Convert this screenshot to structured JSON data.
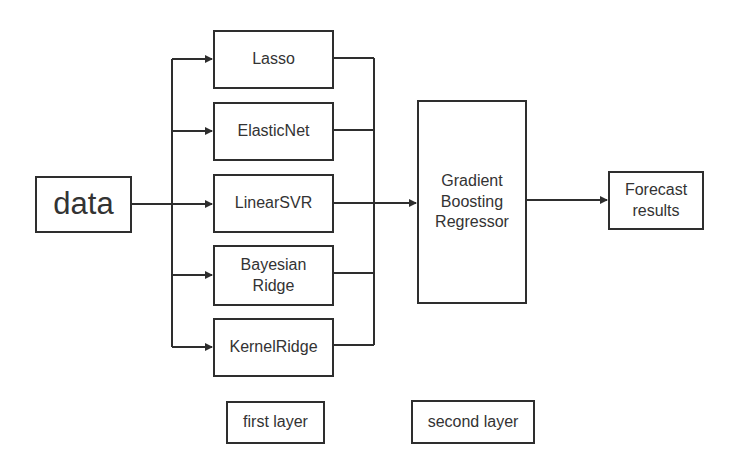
{
  "diagram": {
    "type": "stacking-ensemble-flowchart",
    "input": {
      "label": "data"
    },
    "first_layer": {
      "models": [
        {
          "id": "lasso",
          "label": "Lasso"
        },
        {
          "id": "elasticnet",
          "label": "ElasticNet"
        },
        {
          "id": "linearsvr",
          "label": "LinearSVR"
        },
        {
          "id": "bayesianridge",
          "label_line1": "Bayesian",
          "label_line2": "Ridge"
        },
        {
          "id": "kernelridge",
          "label": "KernelRidge"
        }
      ]
    },
    "second_layer": {
      "model": {
        "line1": "Gradient",
        "line2": "Boosting",
        "line3": "Regressor"
      }
    },
    "output": {
      "line1": "Forecast",
      "line2": "results"
    },
    "legend": {
      "first_layer_label": "first layer",
      "second_layer_label": "second layer"
    },
    "edges": [
      {
        "from": "data",
        "to": "lasso"
      },
      {
        "from": "data",
        "to": "elasticnet"
      },
      {
        "from": "data",
        "to": "linearsvr"
      },
      {
        "from": "data",
        "to": "bayesianridge"
      },
      {
        "from": "data",
        "to": "kernelridge"
      },
      {
        "from": "lasso",
        "to": "gradient-boosting-regressor"
      },
      {
        "from": "elasticnet",
        "to": "gradient-boosting-regressor"
      },
      {
        "from": "linearsvr",
        "to": "gradient-boosting-regressor"
      },
      {
        "from": "bayesianridge",
        "to": "gradient-boosting-regressor"
      },
      {
        "from": "kernelridge",
        "to": "gradient-boosting-regressor"
      },
      {
        "from": "gradient-boosting-regressor",
        "to": "forecast-results"
      }
    ],
    "colors": {
      "stroke": "#2e2e2e",
      "text": "#333333",
      "background": "#ffffff"
    }
  }
}
